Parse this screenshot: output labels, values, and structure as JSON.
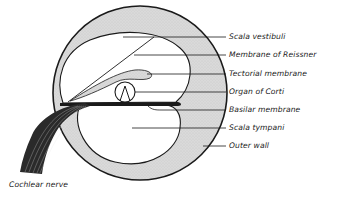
{
  "diagram": {
    "labels": [
      {
        "id": "scala-vestibuli",
        "text": "Scala vestibuli",
        "x": 229,
        "y": 34
      },
      {
        "id": "membrane-of-reissner",
        "text": "Membrane of Reissner",
        "x": 229,
        "y": 52
      },
      {
        "id": "tectorial-membrane",
        "text": "Tectorial membrane",
        "x": 229,
        "y": 71
      },
      {
        "id": "organ-of-corti",
        "text": "Organ of Corti",
        "x": 229,
        "y": 89
      },
      {
        "id": "basilar-membrane",
        "text": "Basilar membrane",
        "x": 229,
        "y": 107
      },
      {
        "id": "scala-tympani",
        "text": "Scala tympani",
        "x": 229,
        "y": 125
      },
      {
        "id": "outer-wall",
        "text": "Outer wall",
        "x": 229,
        "y": 143
      },
      {
        "id": "cochlear-nerve",
        "text": "Cochlear nerve",
        "x": 9,
        "y": 182
      }
    ],
    "colors": {
      "outline": "#1a1a1a",
      "wall_fill": "#d6d6d6",
      "cavity_fill": "#ffffff",
      "nerve": "#222222"
    }
  }
}
